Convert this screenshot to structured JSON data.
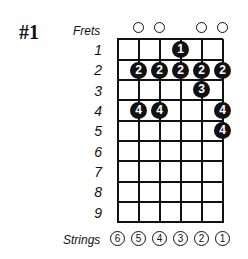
{
  "diagram": {
    "title": "#1",
    "frets_label": "Frets",
    "strings_label": "Strings",
    "fret_numbers": [
      "1",
      "2",
      "3",
      "4",
      "5",
      "6",
      "7",
      "8",
      "9"
    ],
    "string_numbers": [
      "6",
      "5",
      "4",
      "3",
      "2",
      "1"
    ],
    "open_strings": [
      5,
      4,
      2,
      1
    ],
    "finger_positions": [
      {
        "fret": 1,
        "string": 3,
        "finger": "1"
      },
      {
        "fret": 2,
        "string": 5,
        "finger": "2"
      },
      {
        "fret": 2,
        "string": 4,
        "finger": "2"
      },
      {
        "fret": 2,
        "string": 3,
        "finger": "2"
      },
      {
        "fret": 2,
        "string": 2,
        "finger": "2"
      },
      {
        "fret": 2,
        "string": 1,
        "finger": "2"
      },
      {
        "fret": 3,
        "string": 2,
        "finger": "3"
      },
      {
        "fret": 4,
        "string": 5,
        "finger": "4"
      },
      {
        "fret": 4,
        "string": 4,
        "finger": "4"
      },
      {
        "fret": 4,
        "string": 1,
        "finger": "4"
      },
      {
        "fret": 5,
        "string": 1,
        "finger": "4"
      }
    ],
    "colors": {
      "ink": "#111111",
      "background": "#ffffff"
    }
  }
}
